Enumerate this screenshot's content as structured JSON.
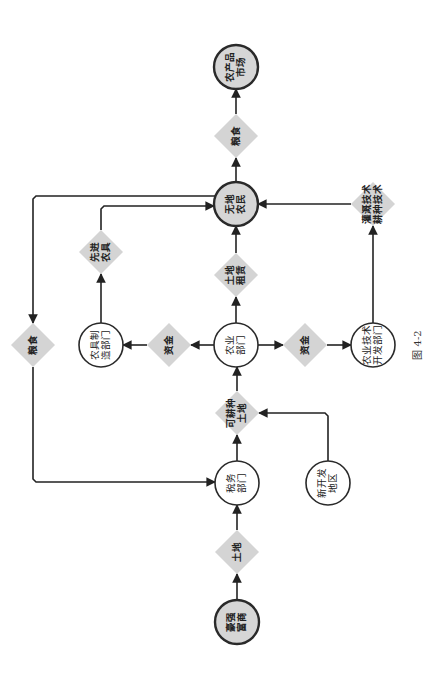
{
  "figure": {
    "caption": "图  4-2",
    "orientation": "rotated 90° counter-clockwise",
    "colors": {
      "terminal_fill": "#d6d6d6",
      "process_fill": "#ffffff",
      "flow_item_fill": "#d4d4d4",
      "line": "#222222"
    }
  },
  "nodes": [
    {
      "id": "market",
      "type": "terminal",
      "lines": [
        "农产品",
        "市场"
      ]
    },
    {
      "id": "landless",
      "type": "terminal",
      "lines": [
        "无地",
        "农民"
      ]
    },
    {
      "id": "gentry",
      "type": "terminal",
      "lines": [
        "豪强",
        "富商"
      ]
    },
    {
      "id": "agri_dept",
      "type": "process",
      "lines": [
        "农业",
        "部门"
      ]
    },
    {
      "id": "tools_dept",
      "type": "process",
      "lines": [
        "农具制",
        "造部门"
      ]
    },
    {
      "id": "tech_dept",
      "type": "process",
      "lines": [
        "农业技术",
        "开发部门"
      ]
    },
    {
      "id": "tax_dept",
      "type": "process",
      "lines": [
        "税务",
        "部门"
      ]
    },
    {
      "id": "new_area",
      "type": "process",
      "lines": [
        "新开发",
        "地区"
      ]
    },
    {
      "id": "grain_top",
      "type": "flow",
      "lines": [
        "粮食"
      ]
    },
    {
      "id": "lease",
      "type": "flow",
      "lines": [
        "土地",
        "租赁"
      ]
    },
    {
      "id": "tech_items",
      "type": "flow",
      "lines": [
        "灌溉技术",
        "耕种技术"
      ]
    },
    {
      "id": "tools",
      "type": "flow",
      "lines": [
        "先进",
        "农具"
      ]
    },
    {
      "id": "grain_left",
      "type": "flow",
      "lines": [
        "粮食"
      ]
    },
    {
      "id": "fund_left",
      "type": "flow",
      "lines": [
        "资金"
      ]
    },
    {
      "id": "fund_right",
      "type": "flow",
      "lines": [
        "资金"
      ]
    },
    {
      "id": "arable",
      "type": "flow",
      "lines": [
        "可耕种",
        "土地"
      ]
    },
    {
      "id": "land",
      "type": "flow",
      "lines": [
        "土地"
      ]
    }
  ],
  "edges": [
    {
      "from": "gentry",
      "to": "land"
    },
    {
      "from": "land",
      "to": "tax_dept"
    },
    {
      "from": "tax_dept",
      "to": "arable"
    },
    {
      "from": "new_area",
      "to": "arable"
    },
    {
      "from": "arable",
      "to": "agri_dept"
    },
    {
      "from": "agri_dept",
      "to": "fund_left"
    },
    {
      "from": "fund_left",
      "to": "tools_dept"
    },
    {
      "from": "agri_dept",
      "to": "fund_right"
    },
    {
      "from": "fund_right",
      "to": "tech_dept"
    },
    {
      "from": "agri_dept",
      "to": "lease"
    },
    {
      "from": "lease",
      "to": "landless"
    },
    {
      "from": "tools_dept",
      "to": "tools"
    },
    {
      "from": "tools",
      "to": "landless"
    },
    {
      "from": "tech_dept",
      "to": "tech_items"
    },
    {
      "from": "tech_items",
      "to": "landless"
    },
    {
      "from": "landless",
      "to": "grain_left"
    },
    {
      "from": "grain_left",
      "to": "tax_dept"
    },
    {
      "from": "landless",
      "to": "grain_top"
    },
    {
      "from": "grain_top",
      "to": "market"
    }
  ]
}
